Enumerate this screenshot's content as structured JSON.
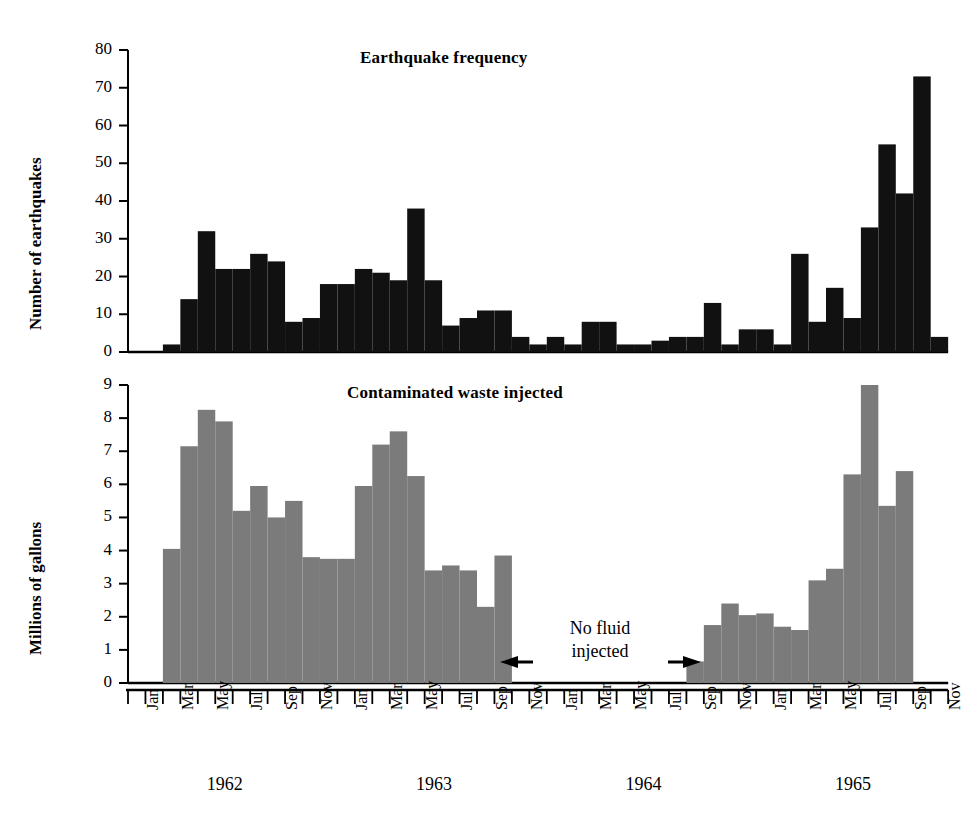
{
  "figure": {
    "width": 972,
    "height": 820,
    "background": "#ffffff",
    "bar_color_top": "#111111",
    "bar_color_bottom": "#7b7b7b",
    "axis_color": "#000000"
  },
  "annotation": {
    "line1": "No fluid",
    "line2": "injected",
    "left_arrow": "left-arrow-icon",
    "right_arrow": "right-arrow-icon"
  },
  "axis": {
    "month_labels": [
      "Jan",
      "Mar",
      "May",
      "Jul",
      "Sep",
      "Nov"
    ],
    "year_labels": [
      "1962",
      "1963",
      "1964",
      "1965"
    ],
    "months_all": [
      "Jan 1962",
      "Feb 1962",
      "Mar 1962",
      "Apr 1962",
      "May 1962",
      "Jun 1962",
      "Jul 1962",
      "Aug 1962",
      "Sep 1962",
      "Oct 1962",
      "Nov 1962",
      "Dec 1962",
      "Jan 1963",
      "Feb 1963",
      "Mar 1963",
      "Apr 1963",
      "May 1963",
      "Jun 1963",
      "Jul 1963",
      "Aug 1963",
      "Sep 1963",
      "Oct 1963",
      "Nov 1963",
      "Dec 1963",
      "Jan 1964",
      "Feb 1964",
      "Mar 1964",
      "Apr 1964",
      "May 1964",
      "Jun 1964",
      "Jul 1964",
      "Aug 1964",
      "Sep 1964",
      "Oct 1964",
      "Nov 1964",
      "Dec 1964",
      "Jan 1965",
      "Feb 1965",
      "Mar 1965",
      "Apr 1965",
      "May 1965",
      "Jun 1965",
      "Jul 1965",
      "Aug 1965",
      "Sep 1965",
      "Oct 1965",
      "Nov 1965"
    ]
  },
  "chart_data": [
    {
      "type": "bar",
      "id": "earthquake-frequency",
      "title": "Earthquake frequency",
      "xlabel": "",
      "ylabel": "Number of earthquakes",
      "ylim": [
        0,
        80
      ],
      "yticks": [
        0,
        10,
        20,
        30,
        40,
        50,
        60,
        70,
        80
      ],
      "grid": false,
      "legend": "none",
      "categories": [
        "Jan 1962",
        "Feb 1962",
        "Mar 1962",
        "Apr 1962",
        "May 1962",
        "Jun 1962",
        "Jul 1962",
        "Aug 1962",
        "Sep 1962",
        "Oct 1962",
        "Nov 1962",
        "Dec 1962",
        "Jan 1963",
        "Feb 1963",
        "Mar 1963",
        "Apr 1963",
        "May 1963",
        "Jun 1963",
        "Jul 1963",
        "Aug 1963",
        "Sep 1963",
        "Oct 1963",
        "Nov 1963",
        "Dec 1963",
        "Jan 1964",
        "Feb 1964",
        "Mar 1964",
        "Apr 1964",
        "May 1964",
        "Jun 1964",
        "Jul 1964",
        "Aug 1964",
        "Sep 1964",
        "Oct 1964",
        "Nov 1964",
        "Dec 1964",
        "Jan 1965",
        "Feb 1965",
        "Mar 1965",
        "Apr 1965",
        "May 1965",
        "Jun 1965",
        "Jul 1965",
        "Aug 1965",
        "Sep 1965",
        "Oct 1965",
        "Nov 1965"
      ],
      "values": [
        0,
        0,
        2,
        14,
        32,
        22,
        22,
        26,
        24,
        8,
        9,
        18,
        18,
        22,
        21,
        19,
        38,
        19,
        7,
        9,
        11,
        11,
        4,
        2,
        4,
        2,
        8,
        8,
        2,
        2,
        3,
        4,
        4,
        13,
        2,
        6,
        6,
        2,
        26,
        8,
        17,
        9,
        33,
        55,
        42,
        73,
        4
      ]
    },
    {
      "type": "bar",
      "id": "contaminated-waste-injected",
      "title": "Contaminated waste injected",
      "xlabel": "",
      "ylabel": "Millions of gallons",
      "ylim": [
        0,
        9
      ],
      "yticks": [
        0,
        1,
        2,
        3,
        4,
        5,
        6,
        7,
        8,
        9
      ],
      "grid": false,
      "legend": "none",
      "categories": [
        "Jan 1962",
        "Feb 1962",
        "Mar 1962",
        "Apr 1962",
        "May 1962",
        "Jun 1962",
        "Jul 1962",
        "Aug 1962",
        "Sep 1962",
        "Oct 1962",
        "Nov 1962",
        "Dec 1962",
        "Jan 1963",
        "Feb 1963",
        "Mar 1963",
        "Apr 1963",
        "May 1963",
        "Jun 1963",
        "Jul 1963",
        "Aug 1963",
        "Sep 1963",
        "Oct 1963",
        "Nov 1963",
        "Dec 1963",
        "Jan 1964",
        "Feb 1964",
        "Mar 1964",
        "Apr 1964",
        "May 1964",
        "Jun 1964",
        "Jul 1964",
        "Aug 1964",
        "Sep 1964",
        "Oct 1964",
        "Nov 1964",
        "Dec 1964",
        "Jan 1965",
        "Feb 1965",
        "Mar 1965",
        "Apr 1965",
        "May 1965",
        "Jun 1965",
        "Jul 1965",
        "Aug 1965",
        "Sep 1965",
        "Oct 1965",
        "Nov 1965"
      ],
      "values": [
        0,
        0,
        4.05,
        7.15,
        8.25,
        7.9,
        5.2,
        5.95,
        5.0,
        5.5,
        3.8,
        3.75,
        3.75,
        5.95,
        7.2,
        7.6,
        6.25,
        3.4,
        3.55,
        3.4,
        2.3,
        3.85,
        0,
        0,
        0,
        0,
        0,
        0,
        0,
        0,
        0,
        0,
        0.65,
        1.75,
        2.4,
        2.05,
        2.1,
        1.7,
        1.6,
        3.1,
        3.45,
        6.3,
        9.0,
        5.35,
        6.4,
        0,
        0
      ]
    }
  ]
}
